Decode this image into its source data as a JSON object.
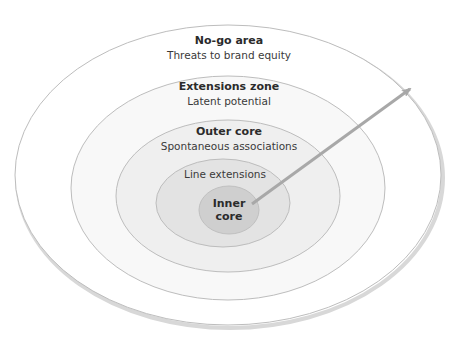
{
  "diagram": {
    "type": "concentric-ellipses",
    "arrow": {
      "direction": "outward",
      "from": "inner-core",
      "to": "no-go-area"
    },
    "colors": {
      "no_go_fill": "#ffffff",
      "extensions_fill": "#f7f7f7",
      "outer_core_fill": "#efefef",
      "line_ext_fill": "#e2e2e2",
      "inner_core_fill": "#cfcfcf",
      "stroke": "#b5b5b5",
      "arrow": "#a8a8a8"
    },
    "zones": [
      {
        "id": "no-go-area",
        "title": "No-go area",
        "subtitle": "Threats to brand equity"
      },
      {
        "id": "extensions-zone",
        "title": "Extensions zone",
        "subtitle": "Latent potential"
      },
      {
        "id": "outer-core",
        "title": "Outer core",
        "subtitle": "Spontaneous associations"
      },
      {
        "id": "line-extensions",
        "title": "",
        "subtitle": "Line extensions"
      },
      {
        "id": "inner-core",
        "title_line1": "Inner",
        "title_line2": "core"
      }
    ]
  }
}
